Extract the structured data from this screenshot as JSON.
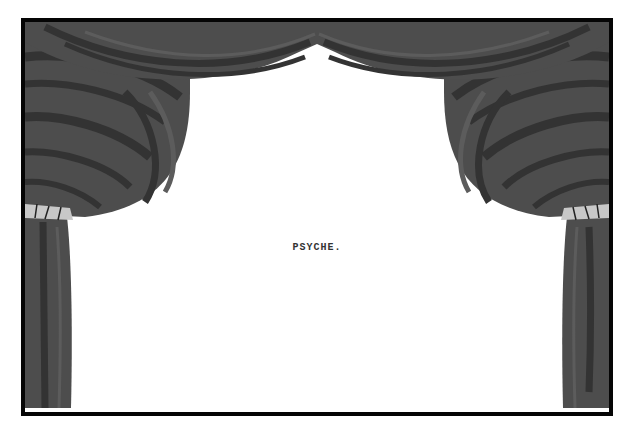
{
  "scene": {
    "title": "PSYCHE.",
    "type": "theater-stage-title-card"
  },
  "colors": {
    "frame_border": "#050505",
    "stage_background": "#ffffff",
    "curtain_base": "#4d4d4d",
    "curtain_stripe_dark": "#333333",
    "curtain_stripe_light": "#5c5c5c",
    "tieback": "#c8c8c8",
    "title_text": "#333333"
  }
}
